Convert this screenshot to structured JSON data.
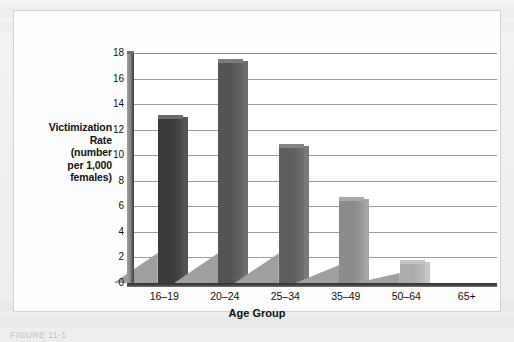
{
  "figure": {
    "caption_partial": "FIGURE 11-1",
    "card_background": "#fdfdfd",
    "page_background": "#efefef"
  },
  "axis_titles": {
    "y_lines": [
      "Victimization",
      "Rate",
      "(number",
      "per 1,000",
      "females)"
    ],
    "x": "Age Group"
  },
  "chart_data": {
    "type": "bar",
    "title": "",
    "subtitle": "",
    "xlabel": "Age Group",
    "ylabel": "Victimization Rate (number per 1,000 females)",
    "categories": [
      "16–19",
      "20–24",
      "25–34",
      "35–49",
      "50–64",
      "65+"
    ],
    "values": [
      12.8,
      17.2,
      10.6,
      6.4,
      1.5,
      0
    ],
    "ylim": [
      0,
      18
    ],
    "ytick_values": [
      0,
      2,
      4,
      6,
      8,
      10,
      12,
      14,
      16,
      18
    ],
    "ytick_labels": [
      "0",
      "2",
      "4",
      "6",
      "8",
      "10",
      "12",
      "14",
      "16",
      "18"
    ],
    "grid": true,
    "grid_orientation": "horizontal",
    "legend": false,
    "legend_position": "none",
    "bar_style": "3d-extruded-with-left-shadow",
    "bar_colors": [
      "#3a3a3a",
      "#545454",
      "#5e5e5e",
      "#8b8b8b",
      "#acacac",
      "#bfbfbf"
    ],
    "bar_top_colors": [
      "#6a6a6a",
      "#7c7c7c",
      "#848484",
      "#a9a9a9",
      "#c4c4c4",
      "#d2d2d2"
    ],
    "shadow_color": "#9f9f9f",
    "gridline_color": "#9a9a9a",
    "axis_color": "#333333",
    "plot_background": "#ffffff"
  }
}
